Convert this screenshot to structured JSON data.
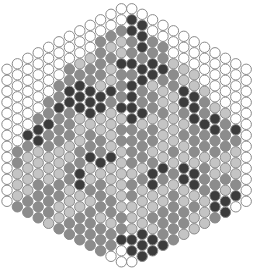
{
  "palette": {
    "W": "#ffffff",
    "L": "#c4c4c4",
    "M": "#8c8c8c",
    "D": "#3c3c3c",
    "stroke": "#8a8a8a"
  },
  "columns": [
    "WWWWWWWWWWWWWWWWWWWWWWWWW",
    "WWWWWWWWMMLLLMLMMWWWWWWWW",
    "WWWWWWWDMLLLLMMMMMWWWWWWW",
    "WWWWWWMDDLLLMMMMMMMWWWWWW",
    "WWWWWMMDMMLLLMMMLMMWWWWWW",
    "WWWWMMDMMMLLLMMLLMMMWWWWW",
    "WWWMMDDMMMLLMMLLLMMMMWWWW",
    "WWWLMDDDLLLMMDDLLMMMMWWWW",
    "WWWLMMDDDLMMDLLMLMMMMWWWW",
    "WWMMMMLDDLLMMDLMMMLMMMWWW",
    "WWMLMLLDMLLLLDLLLMMLMMWWW",
    "WWMLLDMMMDLMMLLLLLLMMDWWW",
    "WDDMMDMDDDDMMMMLMMLLLDDWW",
    "WDDDMDDMMDLMMMLMLLLLDDDWW",
    "WWMMDDLMMLMMLMDDLLMLDDWWW",
    "WWMMDMLLMLLLLDMLLMMMDWWWW",
    "WWWLMMLLLLLMLMLMMMMMWWWWW",
    "WWWLLDDMLMLLDDLLMMLMWWWWW",
    "WWWLLDDDMMMLDDLMLLMWWWWWW",
    "WWWWLMMDMMLMMMLLLMWWWWWWW",
    "WWWWWLDDMMLLMDDMLWWWWWWWW",
    "WWWWWLMMMLLMLDDWWWWWWWWWW",
    "WWWWWWDMLLLMDWWWWWWWWWWWW",
    "WWWWWWWWWWWWWWWWWWWWWWWWW"
  ]
}
